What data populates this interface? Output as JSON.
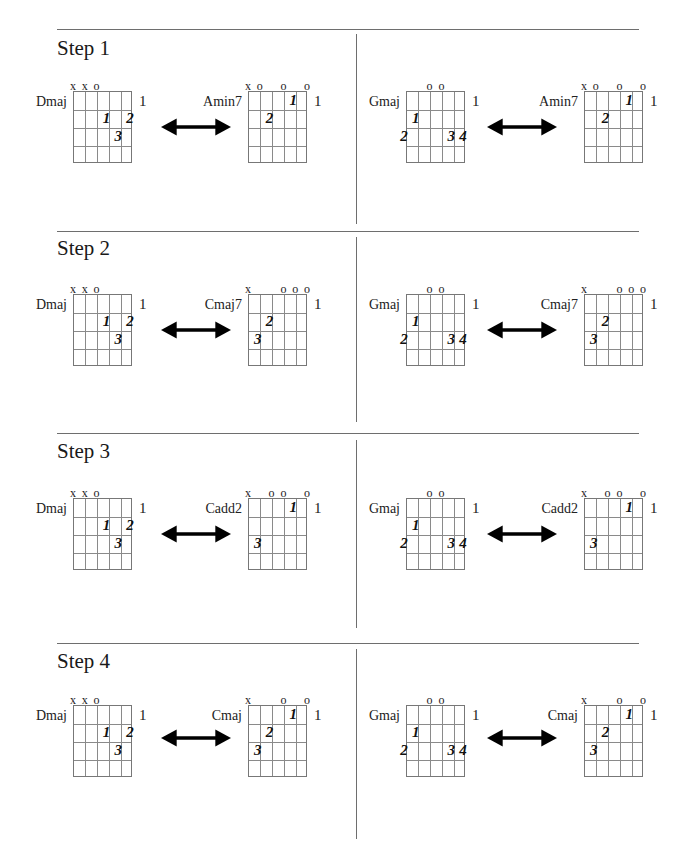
{
  "document": {
    "steps": [
      {
        "title": "Step 1",
        "pairs": [
          {
            "left": {
              "name": "Dmaj",
              "fret": "1",
              "markers": [
                "x",
                "x",
                "o",
                "",
                "",
                ""
              ],
              "fingers": [
                {
                  "string": 4,
                  "fret": 2,
                  "label": "1"
                },
                {
                  "string": 6,
                  "fret": 2,
                  "label": "2"
                },
                {
                  "string": 5,
                  "fret": 3,
                  "label": "3"
                }
              ]
            },
            "right": {
              "name": "Amin7",
              "fret": "1",
              "markers": [
                "x",
                "o",
                "",
                "o",
                "",
                "o"
              ],
              "fingers": [
                {
                  "string": 5,
                  "fret": 1,
                  "label": "1"
                },
                {
                  "string": 3,
                  "fret": 2,
                  "label": "2"
                }
              ]
            }
          },
          {
            "left": {
              "name": "Gmaj",
              "fret": "1",
              "markers": [
                "",
                "",
                "o",
                "o",
                "",
                ""
              ],
              "fingers": [
                {
                  "string": 2,
                  "fret": 2,
                  "label": "1"
                },
                {
                  "string": 1,
                  "fret": 3,
                  "label": "2"
                },
                {
                  "string": 5,
                  "fret": 3,
                  "label": "3"
                },
                {
                  "string": 6,
                  "fret": 3,
                  "label": "4"
                }
              ]
            },
            "right": {
              "name": "Amin7",
              "fret": "1",
              "markers": [
                "x",
                "o",
                "",
                "o",
                "",
                "o"
              ],
              "fingers": [
                {
                  "string": 5,
                  "fret": 1,
                  "label": "1"
                },
                {
                  "string": 3,
                  "fret": 2,
                  "label": "2"
                }
              ]
            }
          }
        ]
      },
      {
        "title": "Step 2",
        "pairs": [
          {
            "left": {
              "name": "Dmaj",
              "fret": "1",
              "markers": [
                "x",
                "x",
                "o",
                "",
                "",
                ""
              ],
              "fingers": [
                {
                  "string": 4,
                  "fret": 2,
                  "label": "1"
                },
                {
                  "string": 6,
                  "fret": 2,
                  "label": "2"
                },
                {
                  "string": 5,
                  "fret": 3,
                  "label": "3"
                }
              ]
            },
            "right": {
              "name": "Cmaj7",
              "fret": "1",
              "markers": [
                "x",
                "",
                "",
                "o",
                "o",
                "o"
              ],
              "fingers": [
                {
                  "string": 3,
                  "fret": 2,
                  "label": "2"
                },
                {
                  "string": 2,
                  "fret": 3,
                  "label": "3"
                }
              ]
            }
          },
          {
            "left": {
              "name": "Gmaj",
              "fret": "1",
              "markers": [
                "",
                "",
                "o",
                "o",
                "",
                ""
              ],
              "fingers": [
                {
                  "string": 2,
                  "fret": 2,
                  "label": "1"
                },
                {
                  "string": 1,
                  "fret": 3,
                  "label": "2"
                },
                {
                  "string": 5,
                  "fret": 3,
                  "label": "3"
                },
                {
                  "string": 6,
                  "fret": 3,
                  "label": "4"
                }
              ]
            },
            "right": {
              "name": "Cmaj7",
              "fret": "1",
              "markers": [
                "x",
                "",
                "",
                "o",
                "o",
                "o"
              ],
              "fingers": [
                {
                  "string": 3,
                  "fret": 2,
                  "label": "2"
                },
                {
                  "string": 2,
                  "fret": 3,
                  "label": "3"
                }
              ]
            }
          }
        ]
      },
      {
        "title": "Step 3",
        "pairs": [
          {
            "left": {
              "name": "Dmaj",
              "fret": "1",
              "markers": [
                "x",
                "x",
                "o",
                "",
                "",
                ""
              ],
              "fingers": [
                {
                  "string": 4,
                  "fret": 2,
                  "label": "1"
                },
                {
                  "string": 6,
                  "fret": 2,
                  "label": "2"
                },
                {
                  "string": 5,
                  "fret": 3,
                  "label": "3"
                }
              ]
            },
            "right": {
              "name": "Cadd2",
              "fret": "1",
              "markers": [
                "x",
                "",
                "o",
                "o",
                "",
                "o"
              ],
              "fingers": [
                {
                  "string": 5,
                  "fret": 1,
                  "label": "1"
                },
                {
                  "string": 2,
                  "fret": 3,
                  "label": "3"
                }
              ]
            }
          },
          {
            "left": {
              "name": "Gmaj",
              "fret": "1",
              "markers": [
                "",
                "",
                "o",
                "o",
                "",
                ""
              ],
              "fingers": [
                {
                  "string": 2,
                  "fret": 2,
                  "label": "1"
                },
                {
                  "string": 1,
                  "fret": 3,
                  "label": "2"
                },
                {
                  "string": 5,
                  "fret": 3,
                  "label": "3"
                },
                {
                  "string": 6,
                  "fret": 3,
                  "label": "4"
                }
              ]
            },
            "right": {
              "name": "Cadd2",
              "fret": "1",
              "markers": [
                "x",
                "",
                "o",
                "o",
                "",
                "o"
              ],
              "fingers": [
                {
                  "string": 5,
                  "fret": 1,
                  "label": "1"
                },
                {
                  "string": 2,
                  "fret": 3,
                  "label": "3"
                }
              ]
            }
          }
        ]
      },
      {
        "title": "Step 4",
        "pairs": [
          {
            "left": {
              "name": "Dmaj",
              "fret": "1",
              "markers": [
                "x",
                "x",
                "o",
                "",
                "",
                ""
              ],
              "fingers": [
                {
                  "string": 4,
                  "fret": 2,
                  "label": "1"
                },
                {
                  "string": 6,
                  "fret": 2,
                  "label": "2"
                },
                {
                  "string": 5,
                  "fret": 3,
                  "label": "3"
                }
              ]
            },
            "right": {
              "name": "Cmaj",
              "fret": "1",
              "markers": [
                "x",
                "",
                "",
                "o",
                "",
                "o"
              ],
              "fingers": [
                {
                  "string": 5,
                  "fret": 1,
                  "label": "1"
                },
                {
                  "string": 3,
                  "fret": 2,
                  "label": "2"
                },
                {
                  "string": 2,
                  "fret": 3,
                  "label": "3"
                }
              ]
            }
          },
          {
            "left": {
              "name": "Gmaj",
              "fret": "1",
              "markers": [
                "",
                "",
                "o",
                "o",
                "",
                ""
              ],
              "fingers": [
                {
                  "string": 2,
                  "fret": 2,
                  "label": "1"
                },
                {
                  "string": 1,
                  "fret": 3,
                  "label": "2"
                },
                {
                  "string": 5,
                  "fret": 3,
                  "label": "3"
                },
                {
                  "string": 6,
                  "fret": 3,
                  "label": "4"
                }
              ]
            },
            "right": {
              "name": "Cmaj",
              "fret": "1",
              "markers": [
                "x",
                "",
                "",
                "o",
                "",
                "o"
              ],
              "fingers": [
                {
                  "string": 5,
                  "fret": 1,
                  "label": "1"
                },
                {
                  "string": 3,
                  "fret": 2,
                  "label": "2"
                },
                {
                  "string": 2,
                  "fret": 3,
                  "label": "3"
                }
              ]
            }
          }
        ]
      }
    ],
    "icons": {
      "transition": "double-headed-arrow-icon"
    },
    "colors": {
      "rule": "#6e6e6e",
      "grid": "#8a8a8a",
      "text": "#111111"
    }
  }
}
